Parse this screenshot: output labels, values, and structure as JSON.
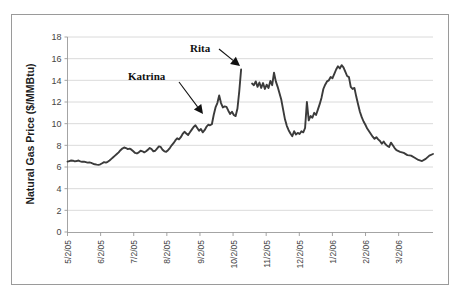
{
  "chart_data": {
    "type": "line",
    "title": "",
    "xlabel": "",
    "ylabel": "Natural Gas Price ($/MMBtu)",
    "ylim": [
      0,
      18
    ],
    "ytick_values": [
      0,
      2,
      4,
      6,
      8,
      10,
      12,
      14,
      16,
      18
    ],
    "ytick_labels": [
      "0",
      "2",
      "4",
      "6",
      "8",
      "10",
      "12",
      "14",
      "16",
      "18"
    ],
    "grid": true,
    "grid_axis": "y",
    "legend": "none",
    "xtick_labels": [
      "5/2/05",
      "6/2/05",
      "7/2/05",
      "8/2/05",
      "9/2/05",
      "10/2/05",
      "11/2/05",
      "12/2/05",
      "1/2/06",
      "2/2/06",
      "3/2/06"
    ],
    "xtick_positions_frac": [
      0.0,
      0.0906,
      0.1812,
      0.2718,
      0.3624,
      0.453,
      0.5436,
      0.6342,
      0.7248,
      0.8154,
      0.906
    ],
    "series": [
      {
        "name": "Natural Gas Price",
        "color": "#3b3b3b",
        "segments": [
          {
            "name": "pre-rita",
            "x": [
              0.0,
              0.005,
              0.01,
              0.015,
              0.02,
              0.025,
              0.03,
              0.035,
              0.04,
              0.045,
              0.05,
              0.055,
              0.06,
              0.065,
              0.07,
              0.075,
              0.08,
              0.085,
              0.09,
              0.095,
              0.1,
              0.105,
              0.11,
              0.115,
              0.12,
              0.125,
              0.13,
              0.135,
              0.14,
              0.145,
              0.15,
              0.155,
              0.16,
              0.165,
              0.17,
              0.175,
              0.18,
              0.185,
              0.19,
              0.195,
              0.2,
              0.205,
              0.21,
              0.215,
              0.22,
              0.225,
              0.23,
              0.235,
              0.24,
              0.245,
              0.25,
              0.255,
              0.26,
              0.265,
              0.27,
              0.275,
              0.28,
              0.285,
              0.29,
              0.295,
              0.3,
              0.305,
              0.31,
              0.315,
              0.32,
              0.325,
              0.33,
              0.335,
              0.34,
              0.345,
              0.35,
              0.355,
              0.36,
              0.365,
              0.37,
              0.375,
              0.38,
              0.385,
              0.39,
              0.395,
              0.4,
              0.405,
              0.41,
              0.415,
              0.42,
              0.425,
              0.43,
              0.435,
              0.44,
              0.445,
              0.45,
              0.455,
              0.46,
              0.465,
              0.47,
              0.475
            ],
            "y": [
              6.5,
              6.55,
              6.6,
              6.58,
              6.52,
              6.55,
              6.6,
              6.52,
              6.48,
              6.5,
              6.45,
              6.4,
              6.42,
              6.38,
              6.3,
              6.25,
              6.22,
              6.2,
              6.25,
              6.35,
              6.45,
              6.4,
              6.48,
              6.6,
              6.75,
              6.9,
              7.05,
              7.2,
              7.35,
              7.55,
              7.7,
              7.8,
              7.75,
              7.65,
              7.7,
              7.6,
              7.45,
              7.3,
              7.25,
              7.35,
              7.5,
              7.45,
              7.35,
              7.45,
              7.6,
              7.75,
              7.65,
              7.45,
              7.5,
              7.7,
              7.9,
              7.85,
              7.6,
              7.45,
              7.4,
              7.55,
              7.75,
              8.0,
              8.2,
              8.45,
              8.65,
              8.55,
              8.75,
              9.05,
              9.25,
              9.1,
              8.95,
              9.2,
              9.45,
              9.7,
              9.85,
              9.6,
              9.35,
              9.5,
              9.2,
              9.4,
              9.7,
              9.9,
              9.85,
              9.95,
              10.8,
              11.5,
              11.9,
              12.6,
              11.9,
              11.5,
              11.6,
              11.55,
              11.2,
              10.9,
              11.1,
              10.8,
              10.7,
              11.4,
              13.0,
              15.0
            ]
          },
          {
            "name": "post-rita",
            "x": [
              0.505,
              0.51,
              0.515,
              0.52,
              0.525,
              0.53,
              0.535,
              0.54,
              0.545,
              0.55,
              0.555,
              0.56,
              0.565,
              0.57,
              0.575,
              0.58,
              0.585,
              0.59,
              0.595,
              0.6,
              0.605,
              0.61,
              0.615,
              0.62,
              0.625,
              0.63,
              0.635,
              0.64,
              0.645,
              0.65,
              0.655,
              0.66,
              0.665,
              0.67,
              0.675,
              0.68,
              0.685,
              0.69,
              0.695,
              0.7,
              0.705,
              0.71,
              0.715,
              0.72,
              0.725,
              0.73,
              0.735,
              0.74,
              0.745,
              0.75,
              0.755,
              0.76,
              0.765,
              0.77,
              0.775,
              0.78,
              0.785,
              0.79,
              0.795,
              0.8,
              0.805,
              0.81,
              0.815,
              0.82,
              0.825,
              0.83,
              0.835,
              0.84,
              0.845,
              0.85,
              0.855,
              0.86,
              0.865,
              0.87,
              0.875,
              0.88,
              0.885,
              0.89,
              0.895,
              0.9,
              0.91,
              0.92,
              0.93,
              0.94,
              0.95,
              0.96,
              0.97,
              0.98,
              0.99,
              1.0
            ],
            "y": [
              13.7,
              13.55,
              13.9,
              13.4,
              13.8,
              13.3,
              13.75,
              13.2,
              13.6,
              13.3,
              13.95,
              13.55,
              14.7,
              13.9,
              13.4,
              12.8,
              12.2,
              11.3,
              10.4,
              9.8,
              9.4,
              9.1,
              8.85,
              9.3,
              9.0,
              9.15,
              9.05,
              9.3,
              9.2,
              9.6,
              12.0,
              10.3,
              10.7,
              10.55,
              11.0,
              10.8,
              11.3,
              11.8,
              12.4,
              13.2,
              13.6,
              13.9,
              14.0,
              14.3,
              14.2,
              14.6,
              15.0,
              15.3,
              15.1,
              15.4,
              15.2,
              14.8,
              14.4,
              14.3,
              13.4,
              13.2,
              13.3,
              12.5,
              11.8,
              11.1,
              10.6,
              10.2,
              9.9,
              9.55,
              9.3,
              9.05,
              8.8,
              8.6,
              8.75,
              8.55,
              8.4,
              8.15,
              8.35,
              8.1,
              7.95,
              7.85,
              8.25,
              8.0,
              7.75,
              7.55,
              7.4,
              7.3,
              7.1,
              7.05,
              6.85,
              6.65,
              6.55,
              6.75,
              7.05,
              7.2
            ]
          }
        ]
      }
    ],
    "annotations": [
      {
        "name": "katrina",
        "label": "Katrina",
        "text_x": 128,
        "text_y": 80,
        "arrow_from_x": 179,
        "arrow_from_y": 82,
        "arrow_to_x": 203,
        "arrow_to_y": 114
      },
      {
        "name": "rita",
        "label": "Rita",
        "text_x": 190,
        "text_y": 52,
        "arrow_from_x": 219,
        "arrow_from_y": 49,
        "arrow_to_x": 240,
        "arrow_to_y": 66
      }
    ]
  },
  "figure": {
    "background": "#ffffff",
    "border_color": "#9a9a9a",
    "line_color": "#3b3b3b",
    "grid_color": "#d0d0d0"
  }
}
